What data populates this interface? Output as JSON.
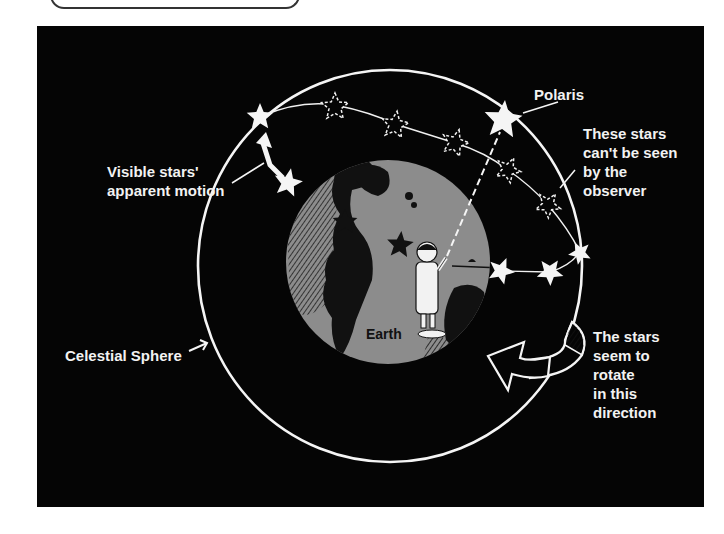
{
  "diagram": {
    "labels": {
      "polaris": "Polaris",
      "hidden_stars": "These stars\ncan't be seen\nby the\nobserver",
      "visible_motion": "Visible stars'\napparent motion",
      "celestial_sphere": "Celestial Sphere",
      "rotation": "The stars\nseem to\nrotate\nin this\ndirection",
      "earth": "Earth"
    },
    "colors": {
      "background": "#050505",
      "sphere_line": "#f5f5f5",
      "earth": "#8c8c8c",
      "land": "#111111",
      "text": "#f2f2f2"
    },
    "elements": {
      "celestial_sphere": {
        "cx": 390,
        "cy": 266,
        "rx": 192,
        "ry": 196
      },
      "earth": {
        "cx": 388,
        "cy": 262,
        "r": 102
      },
      "visible_stars": [
        {
          "x": 260,
          "y": 117,
          "r": 14
        },
        {
          "x": 288,
          "y": 183,
          "r": 15
        },
        {
          "x": 501,
          "y": 271,
          "r": 14
        },
        {
          "x": 550,
          "y": 272,
          "r": 14
        },
        {
          "x": 580,
          "y": 253,
          "r": 12
        }
      ],
      "hidden_stars": [
        {
          "x": 335,
          "y": 107,
          "r": 14
        },
        {
          "x": 395,
          "y": 125,
          "r": 14
        },
        {
          "x": 455,
          "y": 143,
          "r": 14
        },
        {
          "x": 508,
          "y": 170,
          "r": 13
        },
        {
          "x": 548,
          "y": 205,
          "r": 13
        }
      ],
      "polaris": {
        "x": 503,
        "y": 120,
        "r": 20
      },
      "dark_stars_on_earth": [
        {
          "x": 345,
          "y": 222,
          "r": 13
        },
        {
          "x": 400,
          "y": 245,
          "r": 14
        }
      ]
    }
  }
}
